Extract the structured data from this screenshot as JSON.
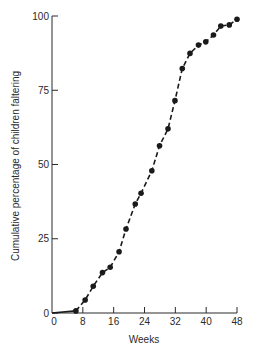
{
  "chart_data": {
    "type": "line",
    "title": "",
    "xlabel": "Weeks",
    "ylabel": "Cumulative percentage of children faltering",
    "xlim": [
      0,
      48
    ],
    "ylim": [
      0,
      100
    ],
    "x_ticks": [
      0,
      8,
      16,
      24,
      32,
      40,
      48
    ],
    "y_ticks": [
      0,
      25,
      50,
      75,
      100
    ],
    "grid": false,
    "legend": null,
    "series": [
      {
        "name": "Cumulative percentage faltering",
        "style": "dashed line with filled circle markers; solid segment from origin to first point",
        "x": [
          0,
          6.2,
          8.6,
          10.7,
          13.1,
          15.1,
          17.4,
          19.2,
          21.6,
          23.1,
          25.9,
          27.9,
          30.1,
          31.9,
          33.8,
          35.8,
          38.0,
          39.9,
          41.9,
          43.8,
          46.0,
          48.0
        ],
        "y": [
          0,
          0.7,
          4.4,
          9.0,
          13.6,
          15.4,
          20.6,
          28.3,
          36.7,
          40.3,
          47.9,
          56.3,
          62.0,
          71.5,
          82.3,
          87.4,
          90.2,
          91.3,
          93.6,
          96.6,
          97.0,
          98.9
        ],
        "markers_from_index": 1
      }
    ]
  },
  "colors": {
    "ink": "#1a1a1a",
    "axis": "#2a2a2a",
    "background": "#ffffff"
  }
}
